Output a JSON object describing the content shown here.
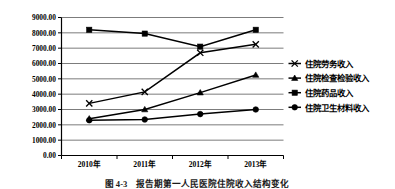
{
  "chart_data": {
    "type": "line",
    "title": "",
    "caption": "图 4-3　报告期第一人民医院住院收入结构变化",
    "xlabel": "",
    "ylabel": "",
    "categories": [
      "2010年",
      "2011年",
      "2012年",
      "2013年"
    ],
    "ylim": [
      0,
      9000
    ],
    "ytick_step": 1000,
    "ytick_labels": [
      "9000.00",
      "8000.00",
      "7000.00",
      "6000.00",
      "5000.00",
      "4000.00",
      "3000.00",
      "2000.00",
      "1000.00",
      "0.00"
    ],
    "ytick_values": [
      9000,
      8000,
      7000,
      6000,
      5000,
      4000,
      3000,
      2000,
      1000,
      0
    ],
    "grid": true,
    "legend_position": "right",
    "series": [
      {
        "name": "住院劳务收入",
        "marker": "x",
        "values": [
          3400,
          4150,
          6700,
          7250
        ]
      },
      {
        "name": "住院检查检验收入",
        "marker": "triangle",
        "values": [
          2400,
          3000,
          4100,
          5250
        ]
      },
      {
        "name": "住院药品收入",
        "marker": "square",
        "values": [
          8200,
          7950,
          7100,
          8200
        ]
      },
      {
        "name": "住院卫生材料收入",
        "marker": "circle",
        "values": [
          2300,
          2350,
          2700,
          3000
        ]
      }
    ],
    "colors": {
      "line": "#000000",
      "grid": "#5a5a5a",
      "axis": "#000000",
      "background": "#ffffff"
    }
  }
}
